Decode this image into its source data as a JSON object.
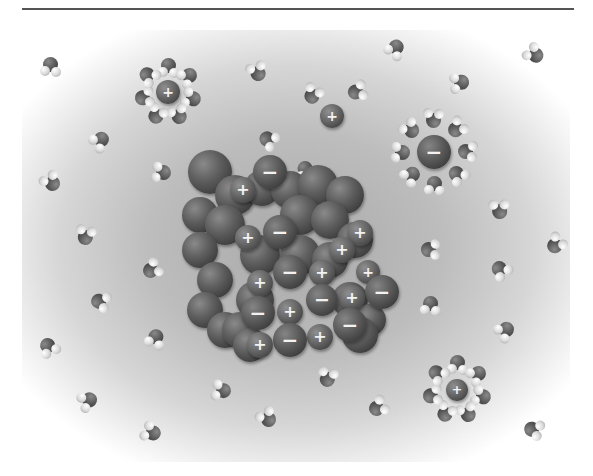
{
  "figure": {
    "colors": {
      "background_center": "#a9a9a9",
      "background_edge": "#ffffff",
      "ion": "#4a4a4a",
      "hydrogen": "#e0e0e0",
      "oxygen": "#555555",
      "rule": "#555555"
    },
    "signs": {
      "plus": "+",
      "minus": "−"
    }
  },
  "crystal": {
    "back_ions": [
      [
        210,
        172,
        22
      ],
      [
        235,
        195,
        20
      ],
      [
        262,
        188,
        18
      ],
      [
        290,
        190,
        19
      ],
      [
        318,
        185,
        20
      ],
      [
        345,
        195,
        19
      ],
      [
        200,
        215,
        18
      ],
      [
        225,
        225,
        20
      ],
      [
        200,
        250,
        18
      ],
      [
        215,
        280,
        18
      ],
      [
        205,
        310,
        18
      ],
      [
        225,
        330,
        18
      ],
      [
        300,
        215,
        20
      ],
      [
        330,
        220,
        19
      ],
      [
        355,
        240,
        18
      ],
      [
        260,
        255,
        20
      ],
      [
        300,
        255,
        20
      ],
      [
        330,
        260,
        18
      ],
      [
        255,
        300,
        19
      ],
      [
        240,
        330,
        18
      ],
      [
        350,
        300,
        18
      ],
      [
        370,
        320,
        16
      ],
      [
        250,
        345,
        17
      ],
      [
        360,
        335,
        18
      ]
    ],
    "labeled_ions": [
      {
        "x": 243,
        "y": 190,
        "r": 13,
        "sign": "+"
      },
      {
        "x": 270,
        "y": 172,
        "r": 17,
        "sign": "−"
      },
      {
        "x": 248,
        "y": 238,
        "r": 13,
        "sign": "+"
      },
      {
        "x": 280,
        "y": 232,
        "r": 17,
        "sign": "−"
      },
      {
        "x": 360,
        "y": 233,
        "r": 13,
        "sign": "+"
      },
      {
        "x": 342,
        "y": 250,
        "r": 13,
        "sign": "+"
      },
      {
        "x": 322,
        "y": 273,
        "r": 13,
        "sign": "+"
      },
      {
        "x": 290,
        "y": 272,
        "r": 17,
        "sign": "−"
      },
      {
        "x": 260,
        "y": 283,
        "r": 13,
        "sign": "+"
      },
      {
        "x": 368,
        "y": 272,
        "r": 12,
        "sign": "+"
      },
      {
        "x": 382,
        "y": 292,
        "r": 17,
        "sign": "−"
      },
      {
        "x": 352,
        "y": 298,
        "r": 13,
        "sign": "+"
      },
      {
        "x": 322,
        "y": 300,
        "r": 16,
        "sign": "−"
      },
      {
        "x": 290,
        "y": 312,
        "r": 13,
        "sign": "+"
      },
      {
        "x": 258,
        "y": 313,
        "r": 17,
        "sign": "−"
      },
      {
        "x": 350,
        "y": 325,
        "r": 17,
        "sign": "−"
      },
      {
        "x": 320,
        "y": 337,
        "r": 13,
        "sign": "+"
      },
      {
        "x": 290,
        "y": 340,
        "r": 17,
        "sign": "−"
      },
      {
        "x": 260,
        "y": 345,
        "r": 13,
        "sign": "+"
      }
    ]
  },
  "free_ions": [
    {
      "x": 332,
      "y": 116,
      "r": 12,
      "sign": "+"
    }
  ],
  "hydrated_ions": [
    {
      "x": 168,
      "y": 92,
      "r": 12,
      "sign": "+",
      "shell_radius": 25
    },
    {
      "x": 434,
      "y": 152,
      "r": 17,
      "sign": "−",
      "shell_radius": 33
    },
    {
      "x": 457,
      "y": 390,
      "r": 11,
      "sign": "+",
      "shell_radius": 26
    }
  ],
  "water_molecules": [
    [
      50,
      66
    ],
    [
      100,
      140
    ],
    [
      162,
      172
    ],
    [
      52,
      182
    ],
    [
      86,
      236
    ],
    [
      152,
      270
    ],
    [
      100,
      302
    ],
    [
      48,
      347
    ],
    [
      155,
      338
    ],
    [
      88,
      400
    ],
    [
      152,
      432
    ],
    [
      258,
      72
    ],
    [
      313,
      95
    ],
    [
      357,
      92
    ],
    [
      268,
      140
    ],
    [
      305,
      170
    ],
    [
      395,
      48
    ],
    [
      460,
      82
    ],
    [
      535,
      54
    ],
    [
      500,
      210
    ],
    [
      556,
      245
    ],
    [
      430,
      250
    ],
    [
      500,
      270
    ],
    [
      430,
      305
    ],
    [
      505,
      330
    ],
    [
      222,
      390
    ],
    [
      268,
      418
    ],
    [
      328,
      378
    ],
    [
      378,
      408
    ],
    [
      533,
      430
    ]
  ]
}
